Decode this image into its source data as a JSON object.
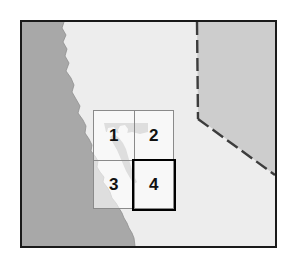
{
  "figure": {
    "kind": "reference-map",
    "region_name": "Northern and Central California coast",
    "width_px": 297,
    "height_px": 264,
    "background_color": "#ffffff"
  },
  "map": {
    "frame_border_color": "#1a1a1a",
    "frame_border_px": 2,
    "land_color": "#ededed",
    "ocean_color": "#a8a8a8",
    "neighbor_state_color": "#cdcdcd",
    "state_line_style": "dashed",
    "state_line_color": "#3c3c3c",
    "features": {
      "ocean_label": "Pacific Ocean",
      "land_label": "California",
      "neighbor_label": "Nevada",
      "bay_label": "San Francisco Bay"
    }
  },
  "inset": {
    "label": "study-area-grid",
    "rows": 2,
    "columns": 2,
    "grid_line_color": "#8a8a8a",
    "highlight_color": "#000000",
    "highlighted_cell": "4",
    "cells": [
      {
        "id": "1",
        "label": "1",
        "row": 1,
        "column": 1,
        "highlighted": false
      },
      {
        "id": "2",
        "label": "2",
        "row": 1,
        "column": 2,
        "highlighted": false
      },
      {
        "id": "3",
        "label": "3",
        "row": 2,
        "column": 1,
        "highlighted": false
      },
      {
        "id": "4",
        "label": "4",
        "row": 2,
        "column": 2,
        "highlighted": true
      }
    ]
  }
}
